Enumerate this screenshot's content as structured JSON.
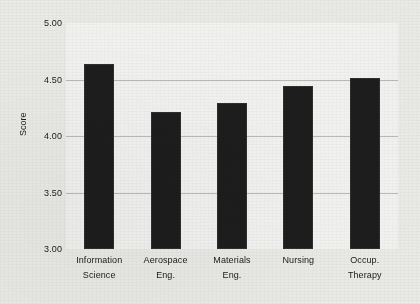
{
  "chart_data": {
    "type": "bar",
    "title": "",
    "xlabel": "",
    "ylabel": "Score",
    "categories": [
      "Information Science",
      "Aerospace Eng.",
      "Materials Eng.",
      "Nursing",
      "Occup. Therapy"
    ],
    "category_lines": [
      [
        "Information",
        "Science"
      ],
      [
        "Aerospace",
        "Eng."
      ],
      [
        "Materials",
        "Eng."
      ],
      [
        "Nursing"
      ],
      [
        "Occup.",
        "Therapy"
      ]
    ],
    "values": [
      4.64,
      4.21,
      4.29,
      4.44,
      4.51
    ],
    "ylim": [
      3.0,
      5.0
    ],
    "yticks": [
      5.0,
      4.5,
      4.0,
      3.5,
      3.0
    ],
    "ytick_labels": [
      "5.00",
      "4.50",
      "4.00",
      "3.50",
      "3.00"
    ],
    "grid": true,
    "grid_axis": "y",
    "legend": "none",
    "bar_color": "#1d1d1d",
    "plot_background": "#f1f1ef",
    "figure_background": "#e9e9e6",
    "axis_color": "#2a2a2a",
    "gridline_color": "#b9b9b6"
  }
}
